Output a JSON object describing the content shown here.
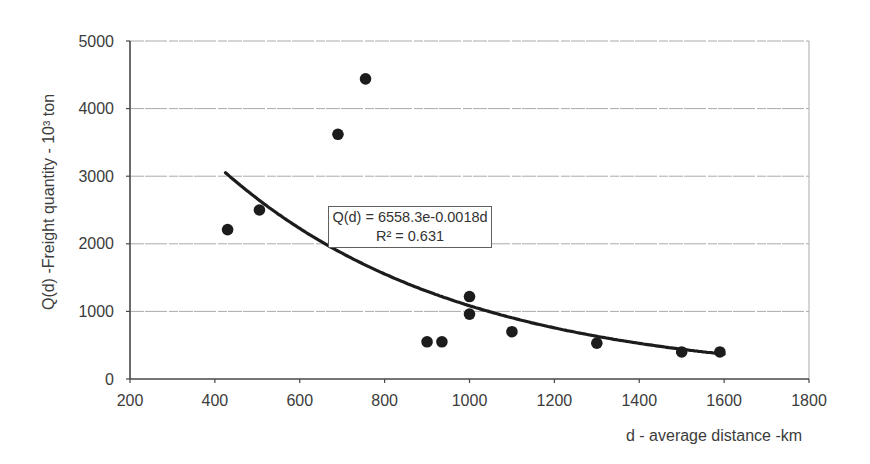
{
  "chart_data": {
    "type": "scatter",
    "title": "",
    "xlabel": "d - average distance -km",
    "ylabel": "Q(d) -Freight quantity - 10³ ton",
    "xlim": [
      200,
      1800
    ],
    "ylim": [
      0,
      5000
    ],
    "x_ticks": [
      200,
      400,
      600,
      800,
      1000,
      1200,
      1400,
      1600,
      1800
    ],
    "y_ticks": [
      0,
      1000,
      2000,
      3000,
      4000,
      5000
    ],
    "grid": "horizontal",
    "legend": "none",
    "points": [
      {
        "x": 430,
        "y": 2210
      },
      {
        "x": 505,
        "y": 2500
      },
      {
        "x": 690,
        "y": 3620
      },
      {
        "x": 755,
        "y": 4440
      },
      {
        "x": 900,
        "y": 550
      },
      {
        "x": 935,
        "y": 550
      },
      {
        "x": 1000,
        "y": 960
      },
      {
        "x": 1000,
        "y": 1220
      },
      {
        "x": 1100,
        "y": 700
      },
      {
        "x": 1300,
        "y": 530
      },
      {
        "x": 1500,
        "y": 400
      },
      {
        "x": 1590,
        "y": 400
      }
    ],
    "trendline": {
      "type": "exponential",
      "a": 6558.3,
      "b": -0.0018,
      "x_start": 425,
      "x_end": 1600,
      "equation_label": "Q(d) = 6558.3e-0.0018d",
      "r2_label": "R² = 0.631"
    },
    "colors": {
      "point": "#1c1c1c",
      "curve": "#1c1c1c",
      "axis": "#474747",
      "grid": "#aaaaaa",
      "text": "#3c3c3c",
      "background": "#ffffff"
    }
  }
}
